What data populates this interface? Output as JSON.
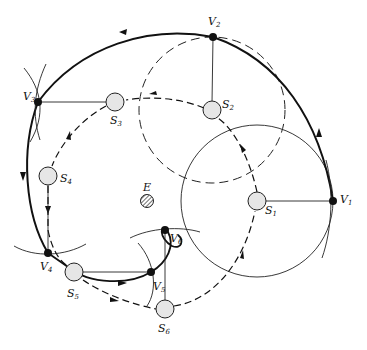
{
  "diagram": {
    "colors": {
      "ink": "#111111",
      "station_fill": "#e6e6e6",
      "vertex_fill": "#111111",
      "background": "#ffffff"
    },
    "central_body": {
      "label": "E",
      "x": 147,
      "y": 201,
      "r": 6,
      "pattern": "hatched"
    },
    "vertices": [
      {
        "id": "V1",
        "letter": "V",
        "sub": "1",
        "x": 333,
        "y": 201
      },
      {
        "id": "V2",
        "letter": "V",
        "sub": "2",
        "x": 213,
        "y": 37
      },
      {
        "id": "V3",
        "letter": "V",
        "sub": "3",
        "x": 38,
        "y": 102
      },
      {
        "id": "V4",
        "letter": "V",
        "sub": "4",
        "x": 48,
        "y": 253
      },
      {
        "id": "V5",
        "letter": "V",
        "sub": "5",
        "x": 151,
        "y": 272
      },
      {
        "id": "V6",
        "letter": "V",
        "sub": "6",
        "x": 165,
        "y": 230
      }
    ],
    "stations": [
      {
        "id": "S1",
        "letter": "S",
        "sub": "1",
        "x": 257,
        "y": 201
      },
      {
        "id": "S2",
        "letter": "S",
        "sub": "2",
        "x": 212,
        "y": 110
      },
      {
        "id": "S3",
        "letter": "S",
        "sub": "3",
        "x": 115,
        "y": 102
      },
      {
        "id": "S4",
        "letter": "S",
        "sub": "4",
        "x": 48,
        "y": 176
      },
      {
        "id": "S5",
        "letter": "S",
        "sub": "5",
        "x": 74,
        "y": 272
      },
      {
        "id": "S6",
        "letter": "S",
        "sub": "6",
        "x": 165,
        "y": 309
      }
    ],
    "circles": [
      {
        "name": "circle-S1",
        "cx": 257,
        "cy": 201,
        "r": 76,
        "style": "solid-thin"
      },
      {
        "name": "circle-S2",
        "cx": 212,
        "cy": 110,
        "r": 73,
        "style": "dashed"
      }
    ],
    "legend": []
  }
}
